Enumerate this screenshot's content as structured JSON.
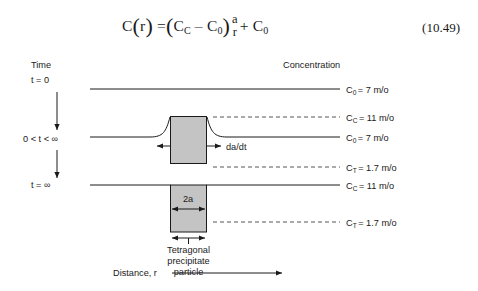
{
  "equation": {
    "lhs": "C",
    "lhs_arg": "r",
    "rhs_term1_a": "C",
    "rhs_term1_a_sub": "C",
    "rhs_minus": "–",
    "rhs_term1_b": "C",
    "rhs_term1_b_sub": "0",
    "frac_num": "a",
    "frac_den": "r",
    "plus": "+",
    "rhs_term2": "C",
    "rhs_term2_sub": "0",
    "number": "(10.49)"
  },
  "figure": {
    "axis_labels": {
      "time_header": "Time",
      "concentration_header": "Concentration",
      "distance_axis": "Distance, r"
    },
    "rows": [
      {
        "id": "t0",
        "time_label": "t = 0"
      },
      {
        "id": "t_middle",
        "time_label": "0 < t < ∞"
      },
      {
        "id": "t_inf",
        "time_label": "t = ∞"
      }
    ],
    "concentration_labels": [
      {
        "id": "c0_top",
        "symbol": "C",
        "sub": "0",
        "value": "= 7 m/o",
        "style": "solid"
      },
      {
        "id": "cc_mid",
        "symbol": "C",
        "sub": "C",
        "value": "= 11 m/o",
        "style": "dashed"
      },
      {
        "id": "c0_mid",
        "symbol": "C",
        "sub": "0",
        "value": "= 7 m/o",
        "style": "solid"
      },
      {
        "id": "ct_mid",
        "symbol": "C",
        "sub": "T",
        "value": "= 1.7 m/o",
        "style": "dashed"
      },
      {
        "id": "cc_bottom",
        "symbol": "C",
        "sub": "C",
        "value": "= 11 m/o",
        "style": "solid"
      },
      {
        "id": "ct_bottom",
        "symbol": "C",
        "sub": "T",
        "value": "= 1.7 m/o",
        "style": "dashed"
      }
    ],
    "annotations": {
      "growth_rate": "da/dt",
      "particle_width": "2a",
      "caption_line1": "Tetragonal",
      "caption_line2": "precipitate",
      "caption_line3": "particle"
    },
    "colors": {
      "line": "#1a1a1a",
      "dashed_line": "#555555",
      "particle_fill": "#c4c4c4",
      "background": "#ffffff"
    }
  }
}
